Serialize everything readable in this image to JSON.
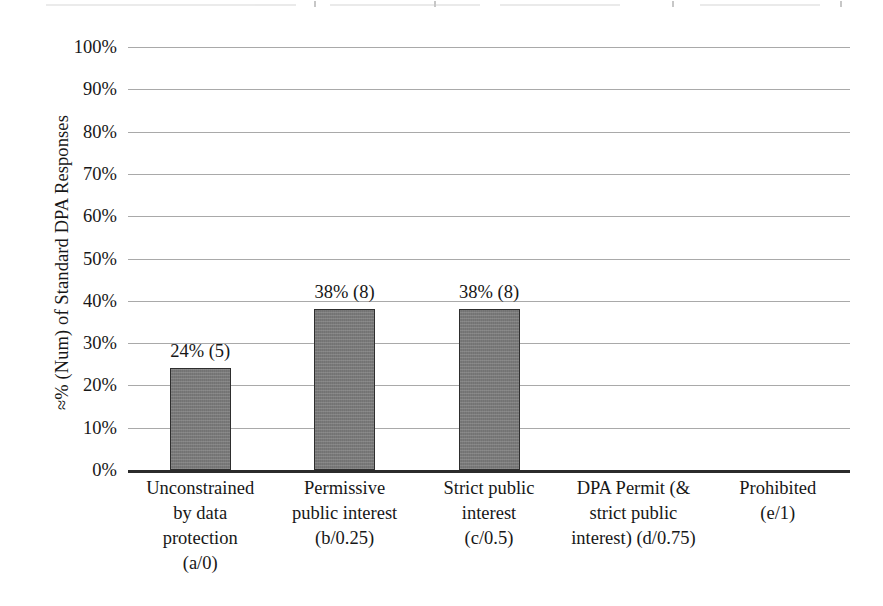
{
  "chart_data": {
    "type": "bar",
    "title": "",
    "subtitle": "",
    "xlabel": "",
    "ylabel": "≈% (Num) of Standard DPA Responses",
    "ylim": [
      0,
      100
    ],
    "grid": true,
    "legend": "none",
    "y_ticks": [
      "0%",
      "10%",
      "20%",
      "30%",
      "40%",
      "50%",
      "60%",
      "70%",
      "80%",
      "90%",
      "100%"
    ],
    "y_tick_values": [
      0,
      10,
      20,
      30,
      40,
      50,
      60,
      70,
      80,
      90,
      100
    ],
    "categories": [
      "Unconstrained by data protection (a/0)",
      "Permissive public interest (b/0.25)",
      "Strict public interest (c/0.5)",
      "DPA Permit (& strict public interest) (d/0.75)",
      "Prohibited (e/1)"
    ],
    "category_lines": [
      [
        "Unconstrained",
        "by data",
        "protection",
        "(a/0)"
      ],
      [
        "Permissive",
        "public interest",
        "(b/0.25)"
      ],
      [
        "Strict public",
        "interest",
        "(c/0.5)"
      ],
      [
        "DPA Permit (&",
        "strict public",
        "interest) (d/0.75)"
      ],
      [
        "Prohibited",
        "(e/1)"
      ]
    ],
    "values": [
      24,
      38,
      38,
      0,
      0
    ],
    "counts": [
      5,
      8,
      8,
      0,
      0
    ],
    "data_labels": [
      "24% (5)",
      "38% (8)",
      "38% (8)",
      "",
      ""
    ],
    "bar_color": "#7f7f7f",
    "bar_border_color": "#2e2e2e",
    "gridline_color": "#9a9a9a",
    "axis_color": "#2b2b2b",
    "background_color": "#ffffff"
  }
}
